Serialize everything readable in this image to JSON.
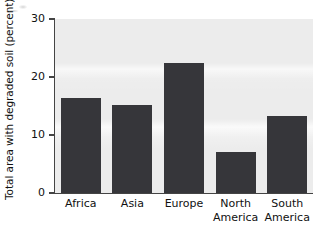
{
  "chart_data": {
    "type": "bar",
    "title": "",
    "xlabel": "",
    "ylabel": "Total area with degraded soil (percent)",
    "categories": [
      "Africa",
      "Asia",
      "Europe",
      "North America",
      "South America"
    ],
    "values": [
      16.3,
      15.2,
      22.5,
      7.1,
      13.2
    ],
    "ylim": [
      0,
      30
    ],
    "yticks": [
      0,
      10,
      20,
      30
    ],
    "ytick_labels": [
      "0",
      "10",
      "20",
      "30"
    ],
    "grid": false,
    "legend": null,
    "series": [
      {
        "name": "Total area with degraded soil (percent)",
        "values": [
          16.3,
          15.2,
          22.5,
          7.1,
          13.2
        ]
      }
    ],
    "colors": {
      "bar": "#36363a",
      "plot_background": "#ececec",
      "axis": "#444444",
      "text": "#111111",
      "figure_background": "#ffffff"
    }
  },
  "axis": {
    "y_title": "Total area with degraded soil (percent)",
    "ticks": [
      {
        "label": "30",
        "value": 30
      },
      {
        "label": "20",
        "value": 20
      },
      {
        "label": "10",
        "value": 10
      },
      {
        "label": "0",
        "value": 0
      }
    ]
  },
  "categories": [
    {
      "line1": "Africa",
      "line2": ""
    },
    {
      "line1": "Asia",
      "line2": ""
    },
    {
      "line1": "Europe",
      "line2": ""
    },
    {
      "line1": "North",
      "line2": "America"
    },
    {
      "line1": "South",
      "line2": "America"
    }
  ]
}
